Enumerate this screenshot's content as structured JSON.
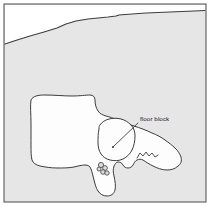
{
  "figure": {
    "type": "archaeological-plan-drawing",
    "width": 210,
    "height": 206,
    "caption_text": "",
    "background_color": "#ffffff",
    "field_fill_color": "#e6e6e6",
    "feature_fill_color": "#fdfdfd",
    "line_color": "#3d3d3d",
    "frame_color": "#4a4a4a",
    "label_color": "#1a1a1a"
  },
  "annotations": [
    {
      "id": "floor-block",
      "text": "floor block",
      "text_x": 140,
      "text_y": 121,
      "leader_from_x": 138,
      "leader_from_y": 123,
      "leader_to_x": 113,
      "leader_to_y": 147
    }
  ],
  "frame": {
    "x": 4,
    "y": 4,
    "width": 202,
    "height": 198,
    "stroke_width": 1
  },
  "geometry": {
    "ridge_line": "M 5,44 L 14,41 L 30,36 L 44,32 L 57,28 L 66,24 L 76,21 L 88,19 L 98,18 L 108,17 L 116,16 L 119,15 L 132,14 L 146,13 L 158,12.5 L 170,12 L 182,11.5 L 194,11 L 205,10.5",
    "upper_white_band": "M 5,44 L 14,41 L 30,36 L 44,32 L 57,28 L 66,24 L 76,21 L 88,19 L 98,18 L 108,17 L 116,16 L 119,15 L 132,14 L 146,13 L 158,12.5 L 170,12 L 182,11.5 L 194,11 L 205,10.5 L 205,5 L 5,5 Z",
    "main_outcrop": "M 31,100 C 33,96 38,95 45,95 C 54,95 64,96 72,96 C 80,96 86,95 90,95 C 93,95 95,97 95,100 C 95,104 96,108 98,111 C 100,114 103,115 106,116 C 110,117 113,118 117,120 C 122,122 128,124 134,126 C 140,128 146,130 152,133 C 157,135 161,137 165,140 C 169,143 172,145 175,148 C 178,151 180,154 181,157 C 182,161 181,164 178,166 C 175,169 171,170 167,170 C 162,170 157,168 153,166 C 149,164 146,162 143,160 C 141,159 139,159 137,160 C 135,161 134,163 133,165 C 132,167 130,168 128,168 C 126,168 124,167 123,165 C 122,163 120,162 118,162 C 116,162 115,164 114,166 C 113,169 113,172 114,176 C 115,181 116,186 115,190 C 114,194 111,196 107,196 C 103,196 100,194 98,191 C 96,188 95,184 94,180 C 93,176 92,172 91,169 C 90,166 88,165 85,165 C 82,165 78,166 74,167 C 69,168 63,168 57,168 C 51,168 45,167 40,166 C 36,165 33,163 32,160 C 31,156 31,151 31,146 C 31,139 31,131 31,123 C 31,114 30,106 31,100 Z",
    "floor_block": "M 100,125 C 102,122 105,120 109,119 C 113,118 117,118 121,119 C 125,120 128,122 131,125 C 134,128 135,132 135,136 C 135,141 134,146 132,150 C 130,154 127,157 123,159 C 119,161 114,161 110,160 C 106,159 103,157 101,154 C 99,151 98,147 98,143 C 98,138 98,133 99,129 C 99,127 99,126 100,125 Z",
    "right_arm_notch": "M 137,158 L 140,153 L 143,156 L 146,152 L 149,156 L 152,153 L 155,157 L 158,155",
    "stone_cluster": [
      {
        "cx": 101,
        "cy": 165,
        "r": 2.6
      },
      {
        "cx": 105,
        "cy": 168,
        "r": 2.4
      },
      {
        "cx": 103,
        "cy": 172,
        "r": 2.3
      },
      {
        "cx": 107,
        "cy": 173,
        "r": 2.2
      },
      {
        "cx": 99,
        "cy": 169,
        "r": 2.0
      }
    ]
  }
}
